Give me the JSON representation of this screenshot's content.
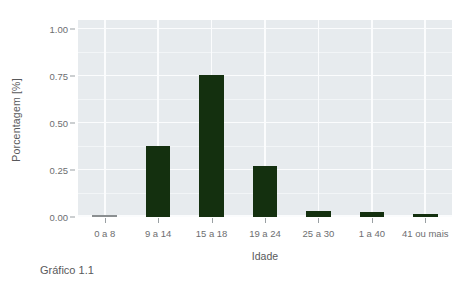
{
  "caption": "Gráfico 1.1",
  "chart_data": {
    "type": "bar",
    "title": "",
    "subtitle": "",
    "xlabel": "Idade",
    "ylabel": "Porcentagem [%]",
    "categories": [
      "0 a 8",
      "9 a 14",
      "15 a 18",
      "19 a 24",
      "25 a 30",
      "1 a 40",
      "41 ou mais"
    ],
    "values": [
      0.0,
      0.38,
      0.755,
      0.272,
      0.032,
      0.025,
      0.018
    ],
    "ylim": [
      0.0,
      1.05
    ],
    "yticks": [
      0.0,
      0.25,
      0.5,
      0.75,
      1.0
    ],
    "ytick_labels": [
      "0.00",
      "0.25",
      "0.50",
      "0.75",
      "1.00"
    ],
    "grid": true,
    "legend": "none",
    "bar_color": "#14300f",
    "zero_bar_color": "#8b8f91",
    "plot_background": "#e7ebee",
    "grid_color": "#fbfcfd",
    "text_color": "#6d6e70"
  }
}
